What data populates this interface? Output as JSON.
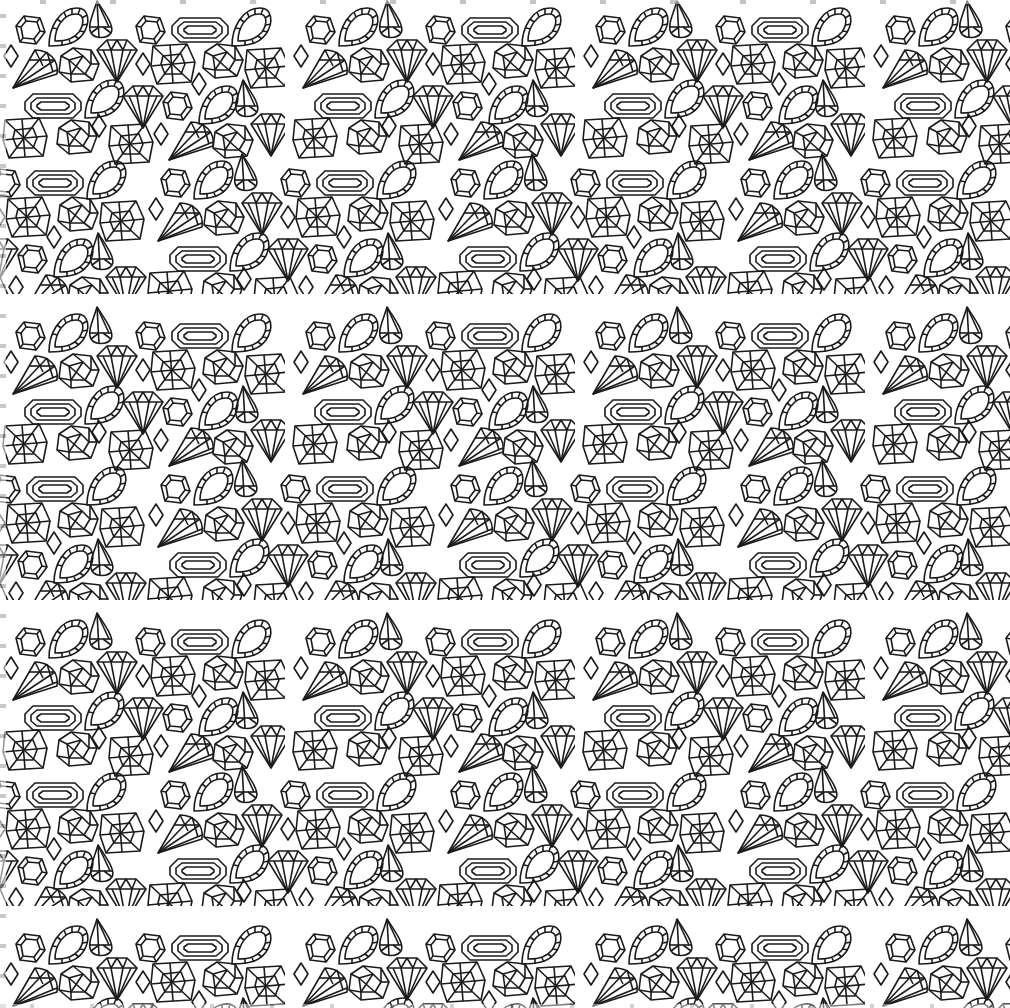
{
  "image": {
    "description": "Seamless black line-art pattern of gemstones on white background",
    "background_color": "#ffffff",
    "line_color": "#1a1a1a",
    "tile": {
      "width": 290,
      "height": 306
    },
    "motifs": [
      {
        "name": "hexagon-gem-icon"
      },
      {
        "name": "beaded-teardrop-gem-icon"
      },
      {
        "name": "pear-drop-gem-icon"
      },
      {
        "name": "emerald-cut-gem-icon"
      },
      {
        "name": "round-brilliant-diamond-icon"
      },
      {
        "name": "cushion-cut-gem-icon"
      },
      {
        "name": "square-faceted-gem-icon"
      },
      {
        "name": "small-rhombus-gem-icon"
      },
      {
        "name": "trillion-fan-gem-icon"
      }
    ]
  }
}
